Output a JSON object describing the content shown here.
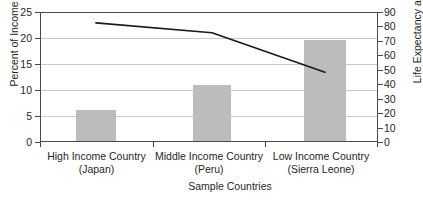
{
  "chart_data": {
    "type": "bar",
    "title": "",
    "categories": [
      "High Income Country",
      "Middle Income Country",
      "Low Income Country"
    ],
    "category_sublabels": [
      "(Japan)",
      "(Peru)",
      "(Sierra Leone)"
    ],
    "xlabel": "Sample Countries",
    "ylabel": "Percent of Income",
    "ylabel_right": "Life Expectancy at Birth",
    "ylim": [
      0,
      25
    ],
    "ylim_right": [
      0,
      90
    ],
    "yticks": [
      0,
      5,
      10,
      15,
      20,
      25
    ],
    "yticks_right": [
      0,
      10,
      20,
      30,
      40,
      50,
      60,
      70,
      80,
      90
    ],
    "grid": true,
    "legend_position": "none",
    "series": [
      {
        "name": "Percent of Income",
        "kind": "bar",
        "axis": "left",
        "values": [
          6.1,
          11.0,
          19.7
        ],
        "color": "#bcbcbc"
      },
      {
        "name": "Life Expectancy at Birth",
        "kind": "line",
        "axis": "right",
        "values": [
          83,
          76,
          48
        ],
        "color": "#1a1a1a"
      }
    ]
  },
  "axes": {
    "left_ticks": [
      "25",
      "20",
      "15",
      "10",
      "5",
      "0"
    ],
    "right_ticks": [
      "90",
      "80",
      "70",
      "60",
      "50",
      "40",
      "30",
      "20",
      "10",
      "0"
    ],
    "left_title": "Percent of Income",
    "right_title": "Life Expectancy at Birth",
    "x_title": "Sample Countries"
  },
  "categories": [
    {
      "name": "High Income Country",
      "sub": "(Japan)"
    },
    {
      "name": "Middle Income Country",
      "sub": "(Peru)"
    },
    {
      "name": "Low Income Country",
      "sub": "(Sierra Leone)"
    }
  ],
  "colors": {
    "bar_fill": "#bcbcbc",
    "line": "#1a1a1a",
    "grid": "#c9c9c9",
    "frame": "#4a4a4a",
    "text": "#1f1f1f",
    "background": "#ffffff"
  }
}
